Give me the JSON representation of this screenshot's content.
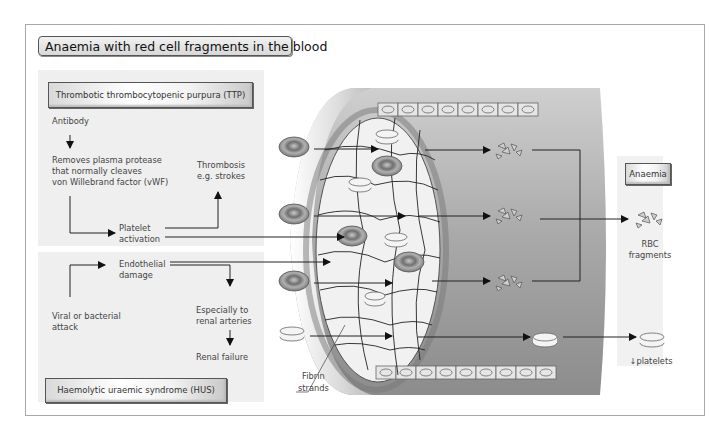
{
  "title": "Anaemia with red cell fragments in the blood",
  "ttp": {
    "heading": "Thrombotic thrombocytopenic purpura (TTP)",
    "antibody": "Antibody",
    "removes_line1": "Removes plasma protease",
    "removes_line2": "that normally cleaves",
    "removes_line3": "von Willebrand factor (vWF)",
    "thrombosis_line1": "Thrombosis",
    "thrombosis_line2": "e.g. strokes",
    "platelet_line1": "Platelet",
    "platelet_line2": "activation"
  },
  "hus": {
    "heading": "Haemolytic uraemic syndrome (HUS)",
    "endothelial_line1": "Endothelial",
    "endothelial_line2": "damage",
    "viral_line1": "Viral or bacterial",
    "viral_line2": "attack",
    "especially_line1": "Especially to",
    "especially_line2": "renal arteries",
    "renal_failure": "Renal failure"
  },
  "vessel": {
    "fibrin_line1": "Fibrin",
    "fibrin_line2": "strands"
  },
  "result": {
    "heading": "Anaemia",
    "rbc_line1": "RBC",
    "rbc_line2": "fragments",
    "platelets": "↓platelets"
  },
  "colors": {
    "panel": "#efefef",
    "vessel_gray": "#9a9a9a",
    "lumen": "#f0f0f0",
    "rbc": "#8a8a8a",
    "line": "#222222"
  }
}
